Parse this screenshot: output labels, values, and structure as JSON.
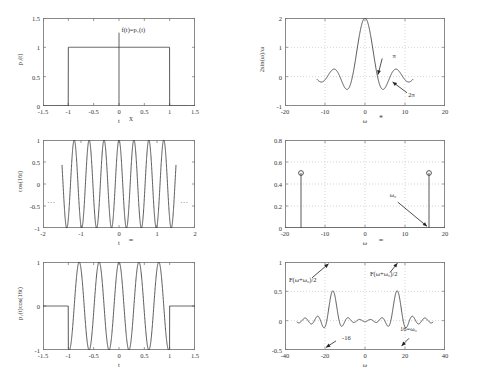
{
  "figure": {
    "layout": "2 columns x 3 rows of plots",
    "line_color": "#3b3b3b",
    "grid_color": "#b9b9b9",
    "axis_color": "#8a8a8a"
  },
  "operators": {
    "time_multiply": "x",
    "time_equals": "=",
    "freq_convolve": "*",
    "freq_equals": "="
  },
  "panels": [
    {
      "id": "p1-time",
      "ylabel": "p₁(t)",
      "xlabel": "t",
      "annotation": "f(t)=p₁(t)",
      "xticks": [
        "-1.5",
        "-1",
        "-0.5",
        "0",
        "0.5",
        "1",
        "1.5"
      ],
      "yticks": [
        "0",
        "0.5",
        "1",
        "1.5"
      ]
    },
    {
      "id": "p1-freq",
      "ylabel": "2sin(ω)/ω",
      "xlabel": "ω",
      "annotation_pi": "π",
      "annotation_2pi": "2π",
      "xticks": [
        "-20",
        "-10",
        "0",
        "10",
        "20"
      ],
      "yticks": [
        "-1",
        "0",
        "1",
        "2"
      ]
    },
    {
      "id": "cos-time",
      "ylabel": "cos(16t)",
      "xlabel": "t",
      "left_ellipsis": "...",
      "right_ellipsis": "...",
      "xticks": [
        "-2",
        "-1",
        "0",
        "1",
        "2"
      ],
      "yticks": [
        "-1",
        "-0.5",
        "0",
        "0.5",
        "1"
      ]
    },
    {
      "id": "cos-freq",
      "ylabel": "",
      "xlabel": "ω",
      "annotation_w0": "ω₀",
      "xticks": [
        "-20",
        "-10",
        "0",
        "10",
        "20"
      ],
      "yticks": [
        "0",
        "0.2",
        "0.4",
        "0.6",
        "0.8"
      ]
    },
    {
      "id": "product-time",
      "ylabel": "p₁(t)cos(16t)",
      "xlabel": "t",
      "xticks": [
        "-1.5",
        "-1",
        "-0.5",
        "0",
        "0.5",
        "1",
        "1.5"
      ],
      "yticks": [
        "-1",
        "0",
        "1"
      ]
    },
    {
      "id": "product-freq",
      "ylabel": "",
      "xlabel": "ω",
      "annotation_left": "F(ω+ω₀)/2",
      "annotation_right": "F(ω+ω₀)/2",
      "annotation_neg16": "-16",
      "annotation_16": "16=ω₀",
      "xticks": [
        "-40",
        "-20",
        "0",
        "20",
        "40"
      ],
      "yticks": [
        "-0.5",
        "0",
        "0.5",
        "1"
      ]
    }
  ],
  "chart_data": [
    {
      "type": "line",
      "id": "p1-time",
      "title": "",
      "xlabel": "t",
      "ylabel": "p₁(t)",
      "xlim": [
        -1.5,
        1.5
      ],
      "ylim": [
        0,
        1.5
      ],
      "grid": false,
      "annotations": [
        {
          "text": "f(t)=p₁(t)",
          "x": 0.05,
          "y": 1.28
        }
      ],
      "description": "Rectangular pulse of amplitude 1 on -1 <= t <= 1, zero elsewhere",
      "series": [
        {
          "name": "p1(t)",
          "x": [
            -1.5,
            -1,
            -1,
            1,
            1,
            1.5
          ],
          "values": [
            0,
            0,
            1,
            1,
            0,
            0
          ]
        }
      ]
    },
    {
      "type": "line",
      "id": "p1-freq",
      "title": "",
      "xlabel": "ω",
      "ylabel": "2sin(ω)/ω",
      "xlim": [
        -20,
        20
      ],
      "ylim": [
        -1,
        2
      ],
      "grid": true,
      "annotations": [
        {
          "text": "π",
          "x": 4.5,
          "y": 0.55
        },
        {
          "text": "2π",
          "x": 9.5,
          "y": -0.55
        }
      ],
      "description": "Sinc-like spectrum 2sin(ω)/ω, peak 2 at ω=0, zeros at multiples of π",
      "series": [
        {
          "name": "2sin(w)/w",
          "x": [
            -12,
            -11,
            -10,
            -9,
            -8,
            -7,
            -6,
            -5,
            -4,
            -3,
            -2,
            -1,
            0,
            1,
            2,
            3,
            4,
            5,
            6,
            7,
            8,
            9,
            10,
            11,
            12
          ],
          "values": [
            -0.09,
            0.18,
            0.11,
            -0.09,
            -0.25,
            -0.19,
            0.09,
            0.38,
            0.38,
            0.09,
            -0.3,
            -0.1,
            2.0,
            -0.1,
            -0.3,
            0.09,
            0.38,
            0.38,
            0.09,
            -0.19,
            -0.25,
            -0.09,
            0.11,
            0.18,
            -0.09
          ]
        }
      ]
    },
    {
      "type": "line",
      "id": "cos-time",
      "title": "",
      "xlabel": "t",
      "ylabel": "cos(16t)",
      "xlim": [
        -2,
        2
      ],
      "ylim": [
        -1,
        1
      ],
      "grid": false,
      "annotations": [
        {
          "text": "...",
          "x": -1.75,
          "y": -0.35
        },
        {
          "text": "...",
          "x": 1.75,
          "y": -0.35
        }
      ],
      "description": "Cosine of frequency 16 rad/s drawn from t=-1.5 to t=1.5 with ellipses indicating continuation"
    },
    {
      "type": "stem",
      "id": "cos-freq",
      "title": "",
      "xlabel": "ω",
      "ylabel": "",
      "xlim": [
        -20,
        20
      ],
      "ylim": [
        0,
        0.8
      ],
      "grid": true,
      "annotations": [
        {
          "text": "ω₀",
          "x": 8.0,
          "y": 0.27
        }
      ],
      "description": "Two impulses of weight 0.5 at ω = -16 and ω = +16, drawn with open-circle markers",
      "x": [
        -16,
        16
      ],
      "values": [
        0.5,
        0.5
      ]
    },
    {
      "type": "line",
      "id": "product-time",
      "title": "",
      "xlabel": "t",
      "ylabel": "p₁(t)cos(16t)",
      "xlim": [
        -1.5,
        1.5
      ],
      "ylim": [
        -1,
        1
      ],
      "grid": false,
      "description": "Product p₁(t)cos(16t): gated cosine, nonzero only for -1 <= t <= 1"
    },
    {
      "type": "line",
      "id": "product-freq",
      "title": "",
      "xlabel": "ω",
      "ylabel": "",
      "xlim": [
        -40,
        40
      ],
      "ylim": [
        -0.5,
        1
      ],
      "grid": true,
      "annotations": [
        {
          "text": "F(ω+ω₀)/2",
          "x": -27,
          "y": 0.72
        },
        {
          "text": "F(ω+ω₀)/2",
          "x": 6,
          "y": 0.78
        },
        {
          "text": "-16",
          "x": -13,
          "y": -0.33
        },
        {
          "text": "16=ω₀",
          "x": 19,
          "y": -0.18
        }
      ],
      "description": "Spectrum of the modulated pulse: two shifted sinc lobes of peak 1 centred at ω = -16 and ω = +16"
    }
  ]
}
